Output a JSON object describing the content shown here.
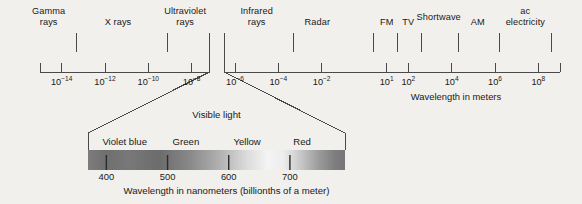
{
  "figure": {
    "background_color": "#f2f0ec",
    "line_color": "#4a4a4a",
    "text_color": "#181818"
  },
  "chart_data": {
    "type": "bar",
    "xlabel": "Wavelength in meters",
    "ylabel": "",
    "grid": false,
    "legend": "none",
    "axis_scale": "log10",
    "axis_range_exponents": [
      -15,
      9
    ],
    "tick_labels": [
      "10-14",
      "10-12",
      "10-10",
      "10-8",
      "10-6",
      "10-4",
      "10-2",
      "101",
      "102",
      "104",
      "106",
      "108"
    ],
    "tick_exponents": [
      -14,
      -12,
      -10,
      -8,
      -6,
      -4,
      -2,
      1,
      2,
      4,
      6,
      8
    ],
    "bands": [
      {
        "name": "Gamma rays",
        "label_exponent": -14.6,
        "start_exponent": -15.0,
        "end_exponent": -13.3
      },
      {
        "name": "X rays",
        "label_exponent": -11.4,
        "start_exponent": -13.3,
        "end_exponent": -9.1
      },
      {
        "name": "Ultraviolet rays",
        "label_exponent": -8.3,
        "start_exponent": -9.1,
        "end_exponent": -7.0
      },
      {
        "name": "Infrared rays",
        "label_exponent": -5.0,
        "start_exponent": -6.6,
        "end_exponent": -3.3
      },
      {
        "name": "Radar",
        "label_exponent": -2.2,
        "start_exponent": -3.3,
        "end_exponent": 0.4
      },
      {
        "name": "FM",
        "label_exponent": 1.0,
        "start_exponent": 0.4,
        "end_exponent": 1.5
      },
      {
        "name": "TV",
        "label_exponent": 2.0,
        "start_exponent": 1.5,
        "end_exponent": 2.6
      },
      {
        "name": "Shortwave",
        "label_exponent": 3.4,
        "start_exponent": 2.6,
        "end_exponent": 4.3
      },
      {
        "name": "AM",
        "label_exponent": 5.2,
        "start_exponent": 4.3,
        "end_exponent": 6.2
      },
      {
        "name": "ac electricity",
        "label_exponent": 7.4,
        "start_exponent": 6.2,
        "end_exponent": 8.6
      }
    ],
    "visible_light": {
      "title": "Visible light",
      "caption": "Wavelength in nanometers (billionths of a meter)",
      "nm_range": [
        370,
        790
      ],
      "nm_ticks": [
        400,
        500,
        600,
        700
      ],
      "colors": [
        {
          "name": "Violet blue",
          "nm": 430
        },
        {
          "name": "Green",
          "nm": 530
        },
        {
          "name": "Yellow",
          "nm": 630
        },
        {
          "name": "Red",
          "nm": 720
        }
      ],
      "callout_source_exponents": [
        -6.9,
        -6.55
      ]
    }
  },
  "labels": {
    "axis_caption": "Wavelength in meters"
  }
}
